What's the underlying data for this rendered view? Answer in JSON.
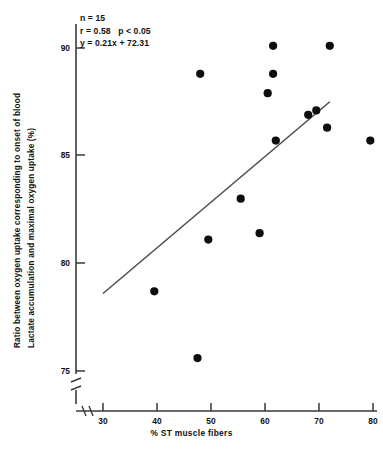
{
  "chart_data": {
    "type": "scatter",
    "title": "",
    "xlabel": "% ST muscle fibers",
    "ylabel": "Ratio between oxygen uptake corresponding to onset of blood lactate accumulation and maximal oxygen uptake (%)",
    "ylabel_line1": "Ratio between oxygen uptake corresponding to onset of blood",
    "ylabel_line2": "Lactate accumulation and maximal oxygen uptake (%)",
    "xlim": [
      30,
      80
    ],
    "ylim": [
      74.0,
      90.8
    ],
    "xticks": [
      30,
      40,
      50,
      60,
      70,
      80
    ],
    "yticks": [
      75,
      80,
      85,
      90
    ],
    "grid": false,
    "axis_break": true,
    "legend": "none",
    "n": 15,
    "r": 0.58,
    "p": "p < 0.05",
    "fit_equation": "y = 0.21x + 72.31",
    "fit_slope": 0.21,
    "fit_intercept": 72.31,
    "fit_line": {
      "x0": 30.0,
      "y0": 78.6,
      "x1": 72.0,
      "y1": 87.5
    },
    "x": [
      39.5,
      47.5,
      48.0,
      49.5,
      55.5,
      59.0,
      60.5,
      61.5,
      61.5,
      62.0,
      68.0,
      69.5,
      71.5,
      72.0,
      79.5
    ],
    "y": [
      78.7,
      75.6,
      88.8,
      81.1,
      83.0,
      81.4,
      87.9,
      88.8,
      90.1,
      85.7,
      86.9,
      87.1,
      86.3,
      90.1,
      85.7
    ],
    "points": [
      {
        "x": 39.5,
        "y": 78.7
      },
      {
        "x": 47.5,
        "y": 75.6
      },
      {
        "x": 48.0,
        "y": 88.8
      },
      {
        "x": 49.5,
        "y": 81.1
      },
      {
        "x": 55.5,
        "y": 83.0
      },
      {
        "x": 59.0,
        "y": 81.4
      },
      {
        "x": 60.5,
        "y": 87.9
      },
      {
        "x": 61.5,
        "y": 88.8
      },
      {
        "x": 61.5,
        "y": 90.1
      },
      {
        "x": 62.0,
        "y": 85.7
      },
      {
        "x": 68.0,
        "y": 86.9
      },
      {
        "x": 69.5,
        "y": 87.1
      },
      {
        "x": 71.5,
        "y": 86.3
      },
      {
        "x": 72.0,
        "y": 90.1
      },
      {
        "x": 79.5,
        "y": 85.7
      }
    ],
    "annotation_lines": [
      "n = 15",
      "r = 0.58   p < 0.05",
      "y = 0.21x + 72.31"
    ]
  },
  "annotation": {
    "block": "n = 15\nr = 0.58   p < 0.05\ny = 0.21x + 72.31"
  },
  "axes": {
    "xtitle": "% ST muscle fibers",
    "ylabel_line1": "Ratio between oxygen uptake corresponding to onset of blood",
    "ylabel_line2": "Lactate accumulation and maximal oxygen uptake (%)",
    "xtick_labels": [
      "30",
      "40",
      "50",
      "60",
      "70",
      "80"
    ],
    "ytick_labels": [
      "75",
      "80",
      "85",
      "90"
    ]
  },
  "style": {
    "axis_color": "#3a3a3a",
    "point_color": "#0d0d0d",
    "line_color": "#4a4a4a",
    "text_color": "#111111"
  }
}
